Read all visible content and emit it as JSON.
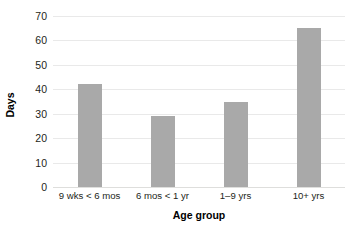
{
  "chart_data": {
    "type": "bar",
    "title": "",
    "subtitle": "",
    "xlabel": "Age group",
    "ylabel": "Days",
    "categories": [
      "9 wks < 6 mos",
      "6 mos < 1 yr",
      "1–9 yrs",
      "10+ yrs"
    ],
    "values": [
      42,
      29,
      35,
      65
    ],
    "ylim": [
      0,
      70
    ],
    "ytick_labels": [
      "0",
      "10",
      "20",
      "30",
      "40",
      "50",
      "60",
      "70"
    ],
    "ytick_values": [
      0,
      10,
      20,
      30,
      40,
      50,
      60,
      70
    ],
    "grid": "horizontal",
    "legend": "none",
    "bar_color": "#a9a9a9",
    "gridline_color": "#e9e9e9",
    "text_color": "#231f20",
    "background_color": "#ffffff"
  }
}
